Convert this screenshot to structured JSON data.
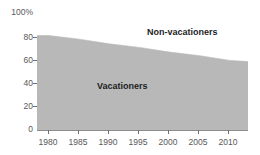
{
  "chart_data": {
    "type": "area",
    "title": "",
    "xlabel": "",
    "ylabel": "",
    "stacked": true,
    "stack_total": 100,
    "grid": false,
    "legend_position": "inline-labels",
    "xlim": [
      1978,
      2013
    ],
    "ylim": [
      0,
      100
    ],
    "x": [
      1978,
      1980,
      1985,
      1990,
      1995,
      2000,
      2005,
      2010,
      2013
    ],
    "xticks": [
      1980,
      1985,
      1990,
      1995,
      2000,
      2005,
      2010
    ],
    "xticklabels": [
      "1980",
      "1985",
      "1990",
      "1995",
      "2000",
      "2005",
      "2010"
    ],
    "yticks": [
      0,
      20,
      40,
      60,
      80,
      100
    ],
    "yticklabels": [
      "0",
      "20",
      "40",
      "60",
      "80",
      "100%"
    ],
    "series": [
      {
        "name": "Vacationers",
        "color": "#b8b8b8",
        "values": [
          80,
          80,
          77,
          73,
          70,
          66,
          63,
          59,
          58
        ]
      },
      {
        "name": "Non-vacationers",
        "color": "#ffffff",
        "values": [
          20,
          20,
          23,
          27,
          30,
          34,
          37,
          41,
          42
        ]
      }
    ],
    "annotations": [
      {
        "text": "Non-vacationers",
        "x": 2001,
        "y": 87
      },
      {
        "text": "Vacationers",
        "x": 1992,
        "y": 41
      }
    ]
  },
  "axes": {
    "y": {
      "ticks": [
        {
          "label": "100%",
          "value": 100
        },
        {
          "label": "80",
          "value": 80
        },
        {
          "label": "60",
          "value": 60
        },
        {
          "label": "40",
          "value": 40
        },
        {
          "label": "20",
          "value": 20
        },
        {
          "label": "0",
          "value": 0
        }
      ]
    },
    "x": {
      "ticks": [
        {
          "label": "1980",
          "value": 1980
        },
        {
          "label": "1985",
          "value": 1985
        },
        {
          "label": "1990",
          "value": 1990
        },
        {
          "label": "1995",
          "value": 1995
        },
        {
          "label": "2000",
          "value": 2000
        },
        {
          "label": "2005",
          "value": 2005
        },
        {
          "label": "2010",
          "value": 2010
        }
      ]
    }
  },
  "labels": {
    "non_vacationers": "Non-vacationers",
    "vacationers": "Vacationers"
  },
  "title_remnant": "",
  "colors": {
    "area_fill": "#b8b8b8",
    "upper_fill": "#ffffff",
    "axis": "#6f6f72",
    "tick_text": "#58585a",
    "label_text": "#1d1d1f",
    "background": "#ffffff"
  }
}
